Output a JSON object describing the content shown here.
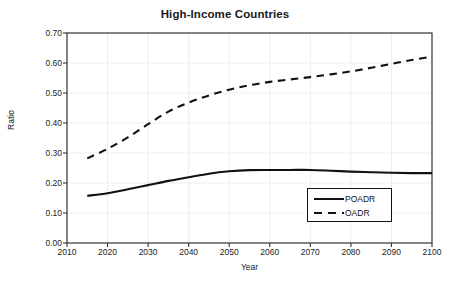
{
  "chart_data": {
    "type": "line",
    "title": "High-Income Countries",
    "xlabel": "Year",
    "ylabel": "Ratio",
    "xlim": [
      2010,
      2100
    ],
    "ylim": [
      0.0,
      0.7
    ],
    "xticks": [
      2010,
      2020,
      2030,
      2040,
      2050,
      2060,
      2070,
      2080,
      2090,
      2100
    ],
    "xtick_labels": [
      "2010",
      "2020",
      "2030",
      "2040",
      "2050",
      "2060",
      "2070",
      "2080",
      "2090",
      "2100"
    ],
    "yticks": [
      0.0,
      0.1,
      0.2,
      0.3,
      0.4,
      0.5,
      0.6,
      0.7
    ],
    "ytick_labels": [
      "0.00",
      "0.10",
      "0.20",
      "0.30",
      "0.40",
      "0.50",
      "0.60",
      "0.70"
    ],
    "grid": true,
    "grid_color": "#ededed",
    "axis_color": "#333333",
    "legend_position": "lower right",
    "x": [
      2015,
      2020,
      2025,
      2030,
      2035,
      2040,
      2045,
      2050,
      2055,
      2060,
      2065,
      2070,
      2075,
      2080,
      2085,
      2090,
      2095,
      2100
    ],
    "series": [
      {
        "name": "POADR",
        "style": "solid",
        "color": "#111111",
        "values": [
          0.157,
          0.166,
          0.179,
          0.193,
          0.207,
          0.219,
          0.231,
          0.239,
          0.243,
          0.2435,
          0.2435,
          0.2435,
          0.241,
          0.238,
          0.236,
          0.234,
          0.233,
          0.233
        ]
      },
      {
        "name": "OADR",
        "style": "dashed",
        "color": "#111111",
        "values": [
          0.282,
          0.314,
          0.352,
          0.396,
          0.438,
          0.468,
          0.492,
          0.511,
          0.526,
          0.537,
          0.545,
          0.553,
          0.562,
          0.572,
          0.584,
          0.597,
          0.61,
          0.621
        ]
      }
    ]
  },
  "legend": {
    "items": [
      {
        "label": "POADR",
        "style": "solid"
      },
      {
        "label": "OADR",
        "style": "dashed"
      }
    ]
  }
}
